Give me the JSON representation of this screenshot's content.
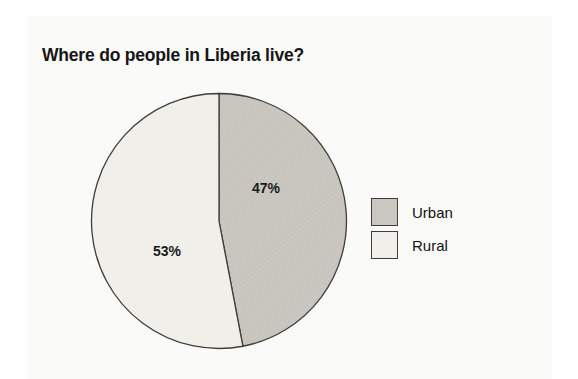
{
  "title": "Where do people in Liberia live?",
  "chart_data": {
    "type": "pie",
    "title": "Where do people in Liberia live?",
    "categories": [
      "Urban",
      "Rural"
    ],
    "values": [
      47,
      53
    ],
    "labels": [
      "47%",
      "53%"
    ],
    "start_angle_deg": 0,
    "direction": "clockwise",
    "legend_position": "right",
    "slice_colors": [
      "#c9c7c0",
      "#f0efe9"
    ],
    "texture_line_color": "#bfbdb6",
    "outline_color": "#3f3e3c",
    "panel_color": "#fafaf8"
  },
  "legend": {
    "items": [
      {
        "label": "Urban",
        "color": "#c9c7c0"
      },
      {
        "label": "Rural",
        "color": "#f0efe9"
      }
    ]
  }
}
